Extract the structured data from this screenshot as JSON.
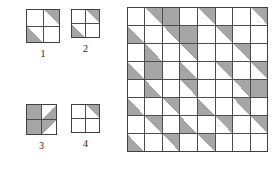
{
  "figure": {
    "background_color": "#ffffff",
    "fill_color": "#a6a6a6",
    "line_color": "#4d4d4d",
    "outer_line_color": "#404040"
  },
  "tiles": [
    {
      "id": "tile-1",
      "label": "1",
      "x": 26,
      "y": 9,
      "size": 34,
      "quadrants": [
        {
          "position": "top-left",
          "shape": "empty"
        },
        {
          "position": "top-right",
          "shape": "triangle",
          "corner": "upper-right"
        },
        {
          "position": "bottom-left",
          "shape": "triangle",
          "corner": "lower-left"
        },
        {
          "position": "bottom-right",
          "shape": "empty"
        }
      ]
    },
    {
      "id": "tile-2",
      "label": "2",
      "x": 71,
      "y": 9,
      "size": 29,
      "quadrants": [
        {
          "position": "top-left",
          "shape": "empty"
        },
        {
          "position": "top-right",
          "shape": "triangle",
          "corner": "upper-right"
        },
        {
          "position": "bottom-left",
          "shape": "triangle",
          "corner": "lower-left"
        },
        {
          "position": "bottom-right",
          "shape": "empty"
        }
      ]
    },
    {
      "id": "tile-3",
      "label": "3",
      "x": 26,
      "y": 104,
      "size": 31,
      "quadrants": [
        {
          "position": "top-left",
          "shape": "filled"
        },
        {
          "position": "top-right",
          "shape": "triangle",
          "corner": "lower-right"
        },
        {
          "position": "bottom-left",
          "shape": "filled"
        },
        {
          "position": "bottom-right",
          "shape": "triangle",
          "corner": "upper-left"
        }
      ]
    },
    {
      "id": "tile-4",
      "label": "4",
      "x": 71,
      "y": 104,
      "size": 29,
      "quadrants": [
        {
          "position": "top-left",
          "shape": "empty"
        },
        {
          "position": "top-right",
          "shape": "triangle",
          "corner": "upper-right"
        },
        {
          "position": "bottom-left",
          "shape": "empty"
        },
        {
          "position": "bottom-right",
          "shape": "empty"
        }
      ]
    }
  ],
  "grid": {
    "id": "big-grid",
    "x": 127,
    "y": 7,
    "width": 141,
    "height": 145,
    "columns": 8,
    "rows": 8,
    "cell_legend": {
      "0": "empty white cell",
      "1": "gray triangle occupying the lower-left half (diagonal from top-left to bottom-right)",
      "2": "gray triangle occupying the upper-right half (diagonal from bottom-left to top-right)",
      "3": "fully filled gray cell"
    },
    "cells": [
      [
        0,
        2,
        3,
        0,
        2,
        0,
        0,
        2
      ],
      [
        1,
        0,
        2,
        3,
        0,
        2,
        0,
        0
      ],
      [
        0,
        1,
        0,
        2,
        0,
        0,
        2,
        0
      ],
      [
        1,
        3,
        0,
        1,
        0,
        2,
        0,
        2
      ],
      [
        0,
        1,
        0,
        2,
        0,
        0,
        2,
        3
      ],
      [
        1,
        0,
        2,
        0,
        1,
        0,
        2,
        0
      ],
      [
        0,
        2,
        0,
        1,
        0,
        2,
        0,
        2
      ],
      [
        1,
        0,
        2,
        0,
        2,
        0,
        0,
        0
      ]
    ]
  }
}
